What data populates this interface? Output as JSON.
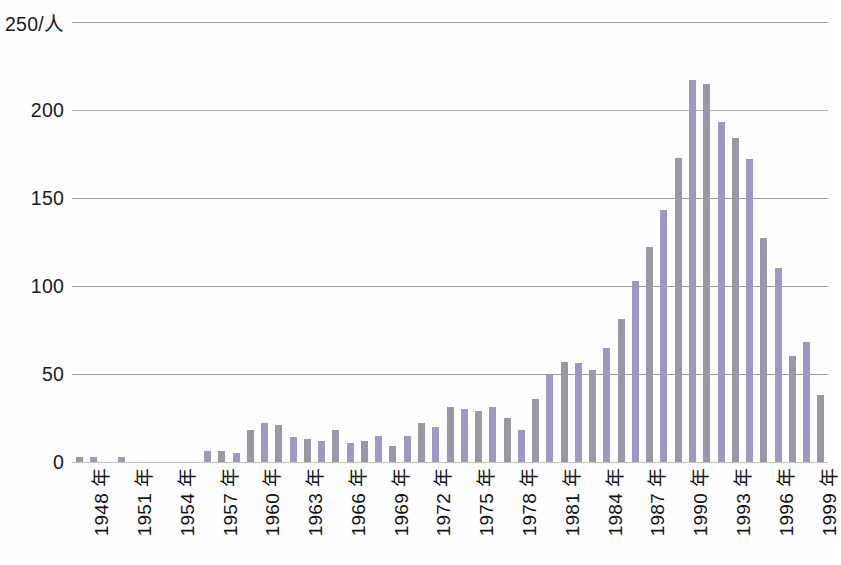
{
  "chart_data": {
    "type": "bar",
    "title": "",
    "xlabel": "",
    "ylabel": "250/人",
    "ylim": [
      0,
      250
    ],
    "yticks": [
      0,
      50,
      100,
      150,
      200,
      250
    ],
    "ytick_labels": [
      "0",
      "50",
      "100",
      "150",
      "200",
      "250/人"
    ],
    "grid": true,
    "legend": "none",
    "xtick_labels": [
      "1948 年",
      "1951 年",
      "1954 年",
      "1957 年",
      "1960 年",
      "1963 年",
      "1966 年",
      "1969 年",
      "1972 年",
      "1975 年",
      "1978 年",
      "1981 年",
      "1984 年",
      "1987 年",
      "1990 年",
      "1993 年",
      "1996 年",
      "1999 年"
    ],
    "xtick_step_years": 3,
    "year_suffix": "年",
    "bar_color": "#9e95bd",
    "bar_color_alt": "#9a98a6",
    "categories": [
      "1948",
      "1949",
      "1950",
      "1951",
      "1952",
      "1953",
      "1954",
      "1955",
      "1956",
      "1957",
      "1958",
      "1959",
      "1960",
      "1961",
      "1962",
      "1963",
      "1964",
      "1965",
      "1966",
      "1967",
      "1968",
      "1969",
      "1970",
      "1971",
      "1972",
      "1973",
      "1974",
      "1975",
      "1976",
      "1977",
      "1978",
      "1979",
      "1980",
      "1981",
      "1982",
      "1983",
      "1984",
      "1985",
      "1986",
      "1987",
      "1988",
      "1989",
      "1990",
      "1991",
      "1992",
      "1993",
      "1994",
      "1995",
      "1996",
      "1997",
      "1998",
      "1999",
      "2000"
    ],
    "values": [
      3,
      3,
      0,
      3,
      0,
      0,
      0,
      0,
      0,
      6,
      6,
      5,
      18,
      22,
      21,
      14,
      13,
      12,
      18,
      11,
      12,
      15,
      9,
      15,
      22,
      20,
      31,
      30,
      29,
      31,
      25,
      18,
      36,
      50,
      57,
      56,
      52,
      65,
      81,
      103,
      122,
      143,
      173,
      217,
      215,
      193,
      184,
      172,
      127,
      110,
      60,
      68,
      38
    ]
  }
}
